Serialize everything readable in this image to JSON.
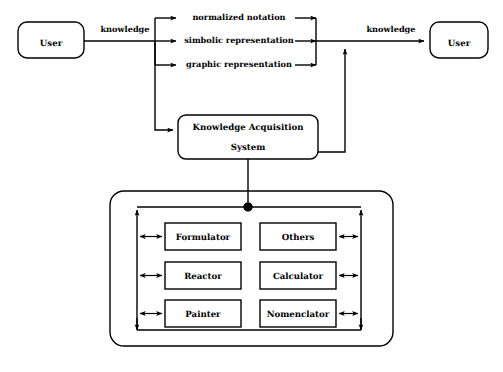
{
  "diagram": {
    "colors": {
      "stroke": "#000000",
      "background": "#ffffff",
      "text": "#000000"
    },
    "actors": {
      "user_left": "User",
      "user_right": "User"
    },
    "edge_labels": {
      "knowledge_in": "knowledge",
      "knowledge_out": "knowledge"
    },
    "representations": [
      {
        "label": "normalized notation"
      },
      {
        "label": "simbolic representation"
      },
      {
        "label": "graphic representation"
      }
    ],
    "system": {
      "line1": "Knowledge Acquisition",
      "line2": "System"
    },
    "modules": {
      "left_column": [
        {
          "label": "Formulator"
        },
        {
          "label": "Reactor"
        },
        {
          "label": "Painter"
        }
      ],
      "right_column": [
        {
          "label": "Others"
        },
        {
          "label": "Calculator"
        },
        {
          "label": "Nomenclator"
        }
      ]
    }
  }
}
